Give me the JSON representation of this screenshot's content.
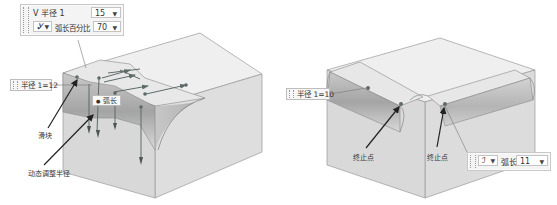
{
  "left_figure": {
    "toolbar": {
      "row1_label": "V 半径 1",
      "row1_value": "15",
      "mode_icon": "arc-mode-icon",
      "mode_glyph": "Ꮍ",
      "row2_label": "弧长百分比",
      "row2_value": "70"
    },
    "radius_tag": "半径 1=12",
    "arc_tag": "弧长",
    "arc_tag_icon": "arc-dot-icon",
    "callout_slider": "滑块",
    "callout_dynamic": "动态调整半径"
  },
  "right_figure": {
    "radius_tag": "半径 1=10",
    "callout_end_left": "终止点",
    "callout_end_right": "终止点",
    "toolbar": {
      "mode_icon": "arc-mode-icon",
      "mode_glyph": "ℐ",
      "label": "弧长",
      "value": "11"
    }
  },
  "colors": {
    "top_face": "#efefef",
    "side_face": "#dcdcdc",
    "fillet_dark": "#a9a9a9",
    "fillet_light": "#d4d4d4",
    "edge": "#8a8a8a",
    "arrow": "#222222",
    "handle": "#5e6a6a"
  }
}
